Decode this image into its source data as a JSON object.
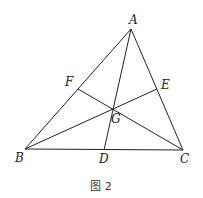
{
  "caption": "图 2",
  "points": {
    "A": {
      "label": "A",
      "x": 131,
      "y": 29,
      "lx": 129,
      "ly": 24
    },
    "B": {
      "label": "B",
      "x": 25,
      "y": 149,
      "lx": 15,
      "ly": 162
    },
    "C": {
      "label": "C",
      "x": 183,
      "y": 150,
      "lx": 180,
      "ly": 163
    },
    "D": {
      "label": "D",
      "x": 104,
      "y": 150,
      "lx": 99,
      "ly": 163
    },
    "E": {
      "label": "E",
      "x": 157,
      "y": 89,
      "lx": 161,
      "ly": 89
    },
    "F": {
      "label": "F",
      "x": 78,
      "y": 89,
      "lx": 65,
      "ly": 86
    },
    "G": {
      "label": "G",
      "x": 113,
      "y": 109,
      "lx": 111,
      "ly": 123
    }
  },
  "segments": [
    [
      "A",
      "B"
    ],
    [
      "B",
      "C"
    ],
    [
      "C",
      "A"
    ],
    [
      "A",
      "D"
    ],
    [
      "B",
      "E"
    ],
    [
      "C",
      "F"
    ]
  ]
}
